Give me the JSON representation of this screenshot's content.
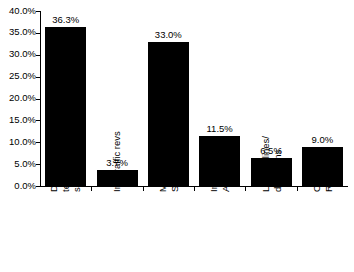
{
  "chart_data": {
    "type": "bar",
    "title": "",
    "subtitle": "",
    "xlabel": "",
    "ylabel": "",
    "ylim": [
      0,
      40
    ],
    "grid": false,
    "legend": false,
    "value_suffix": "%",
    "categories": [
      "Domestic telecom services",
      "Int'l traffic revs",
      "Mobile Services",
      "International Activities",
      "Leased lines/ data trans.",
      "Other Revenues"
    ],
    "values": [
      36.3,
      3.7,
      33.0,
      11.5,
      6.5,
      9.0
    ],
    "value_labels": [
      "36.3%",
      "3.7%",
      "33.0%",
      "11.5%",
      "6.5%",
      "9.0%"
    ],
    "category_label_lines": [
      [
        "Domestic",
        "telecom",
        "services"
      ],
      [
        "Int'l traffic revs"
      ],
      [
        "Mobile",
        "Services"
      ],
      [
        "International",
        "Activities"
      ],
      [
        "Leased lines/",
        "data trans."
      ],
      [
        "Other",
        "Revenues"
      ]
    ],
    "y_ticks": [
      0,
      5,
      10,
      15,
      20,
      25,
      30,
      35,
      40
    ],
    "y_tick_labels": [
      "0.0%",
      "5.0%",
      "10.0%",
      "15.0%",
      "20.0%",
      "25.0%",
      "30.0%",
      "35.0%",
      "40.0%"
    ],
    "bar_color": "#000000",
    "axis_color": "#000000",
    "background_color": "#ffffff"
  }
}
